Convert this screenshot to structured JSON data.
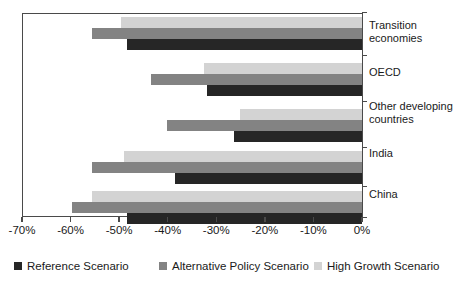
{
  "chart_data": {
    "type": "bar",
    "orientation": "horizontal",
    "title": "",
    "subtitle": "",
    "xlabel": "",
    "ylabel": "",
    "xlim": [
      -70,
      0
    ],
    "xtick_values": [
      -70,
      -60,
      -50,
      -40,
      -30,
      -20,
      -10,
      0
    ],
    "xtick_labels": [
      "-70%",
      "-60%",
      "-50%",
      "-40%",
      "-30%",
      "-20%",
      "-10%",
      "0%"
    ],
    "grid": false,
    "legend_position": "bottom",
    "categories": [
      "Transition economies",
      "OECD",
      "Other developing countries",
      "India",
      "China"
    ],
    "category_labels": [
      [
        "Transition",
        "economies"
      ],
      [
        "OECD"
      ],
      [
        "Other developing",
        "countries"
      ],
      [
        "India"
      ],
      [
        "China"
      ]
    ],
    "series": [
      {
        "name": "Reference Scenario",
        "color": "#262626",
        "values": [
          -48.4,
          -31.9,
          -26.3,
          -38.5,
          -48.4
        ]
      },
      {
        "name": "Alternative Policy Scenario",
        "color": "#838383",
        "values": [
          -55.5,
          -43.5,
          -40.2,
          -55.5,
          -59.8
        ]
      },
      {
        "name": "High Growth Scenario",
        "color": "#d3d3d3",
        "values": [
          -49.7,
          -32.5,
          -25.1,
          -49.1,
          -55.5
        ]
      }
    ]
  },
  "legend": {
    "items": [
      {
        "label": "Reference Scenario",
        "color": "#262626"
      },
      {
        "label": "Alternative Policy Scenario",
        "color": "#838383"
      },
      {
        "label": "High Growth Scenario",
        "color": "#d3d3d3"
      }
    ]
  },
  "axis": {
    "x_labels": [
      "-70%",
      "-60%",
      "-50%",
      "-40%",
      "-30%",
      "-20%",
      "-10%",
      "0%"
    ]
  },
  "categories": {
    "transition": {
      "line1": "Transition",
      "line2": "economies"
    },
    "oecd": {
      "line1": "OECD"
    },
    "other_developing": {
      "line1": "Other developing",
      "line2": "countries"
    },
    "india": {
      "line1": "India"
    },
    "china": {
      "line1": "China"
    }
  }
}
